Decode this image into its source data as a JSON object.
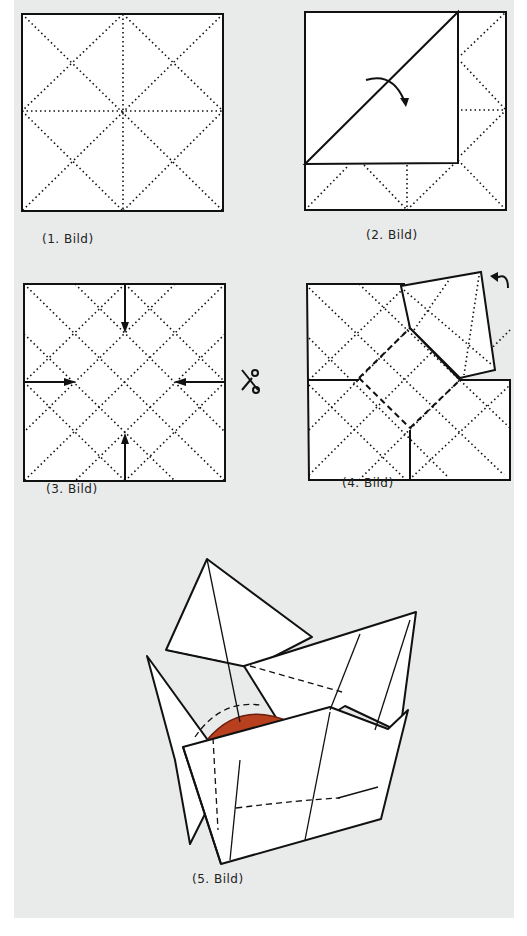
{
  "document": {
    "type": "origami folding instructions",
    "colors": {
      "paper_background": "#e9eaea",
      "sheet_fill": "#ffffff",
      "line": "#111111",
      "fruit": "#b8401e",
      "fruit_dark": "#6a1f0c"
    }
  },
  "figures": [
    {
      "id": 1,
      "caption": "(1. Bild)",
      "description": "square sheet with fold lines: diagonals, center cross and inner diamond"
    },
    {
      "id": 2,
      "caption": "(2. Bild)",
      "description": "corner folded over diagonal, curved arrow indicating fold"
    },
    {
      "id": 3,
      "caption": "(3. Bild)",
      "description": "square with diamond grid crease pattern and four arrows pointing inward; scissors symbol to the right",
      "side_icon": "scissors-icon"
    },
    {
      "id": 4,
      "caption": "(4. Bild)",
      "description": "cut sheet with one flap lifted, curved arrow at top-right"
    },
    {
      "id": 5,
      "caption": "(5. Bild)",
      "description": "finished folded basket holding a red fruit"
    }
  ]
}
